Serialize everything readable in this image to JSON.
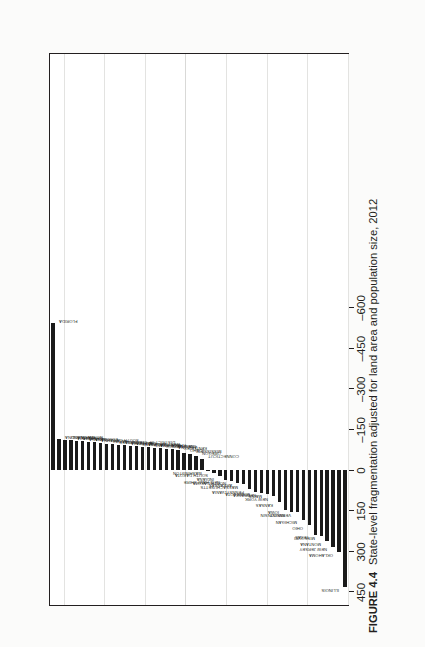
{
  "figure": {
    "number": "FIGURE 4.4",
    "caption": "State-level fragmentation adjusted for land area and population size, 2012"
  },
  "chart_data": {
    "type": "bar",
    "title": "State-level fragmentation adjusted for land area and population size, 2012",
    "xlabel": "",
    "ylabel": "",
    "orientation": "vertical-bars-on-rotated-page",
    "grid": true,
    "legend": null,
    "ylim": [
      -600,
      500
    ],
    "yticks": [
      -600,
      -450,
      -300,
      -150,
      0,
      150,
      300,
      450
    ],
    "ytick_labels": [
      "–600",
      "–450",
      "–300",
      "–150",
      "0",
      "150",
      "300",
      "450"
    ],
    "categories": [
      "FLORIDA",
      "NORTH CAROLINA",
      "MARYLAND",
      "VIRGINIA",
      "GEORGIA",
      "NEVADA",
      "LOUISIANA",
      "SOUTH CAROLINA",
      "UTAH",
      "HAWAII",
      "TENNESSEE",
      "DISTRICT OF COLUMBIA",
      "CALIFORNIA",
      "ALASKA",
      "DELAWARE",
      "WEST VIRGINIA",
      "RHODE ISLAND",
      "ALABAMA",
      "NEW MEXICO",
      "COLORADO",
      "ARIZONA",
      "KENTUCKY",
      "IDAHO",
      "MISSISSIPPI",
      "OREGON",
      "CONNECTICUT",
      "WASHINGTON",
      "SOUTH DAKOTA",
      "INDIANA",
      "NEW HAMPSHIRE",
      "NORTH DAKOTA",
      "ARKANSAS",
      "MASSACHUSETTS",
      "PENNSYLVANIA",
      "MINNESOTA",
      "NEBRASKA",
      "MAINE",
      "NEW YORK",
      "KANSAS",
      "IOWA",
      "WISCONSIN",
      "VERMONT",
      "MICHIGAN",
      "OHIO",
      "TEXAS",
      "MISSOURI",
      "MONTANA",
      "NEW JERSEY",
      "OKLAHOMA",
      "ILLINOIS"
    ],
    "values": [
      -540,
      -112,
      -110,
      -108,
      -106,
      -104,
      -102,
      -100,
      -98,
      -96,
      -94,
      -92,
      -90,
      -88,
      -86,
      -84,
      -82,
      -80,
      -78,
      -76,
      -74,
      -72,
      -62,
      -58,
      -50,
      -40,
      5,
      12,
      25,
      38,
      42,
      48,
      55,
      72,
      82,
      86,
      90,
      98,
      120,
      148,
      158,
      158,
      185,
      205,
      240,
      245,
      265,
      285,
      305,
      435
    ]
  },
  "axis": {
    "ticks": [
      {
        "value": -600,
        "label": "–600"
      },
      {
        "value": -450,
        "label": "–450"
      },
      {
        "value": -300,
        "label": "–300"
      },
      {
        "value": -150,
        "label": "–150"
      },
      {
        "value": 0,
        "label": "0"
      },
      {
        "value": 150,
        "label": "150"
      },
      {
        "value": 300,
        "label": "300"
      },
      {
        "value": 450,
        "label": "450"
      }
    ]
  },
  "colors": {
    "bar": "#1a1a1a",
    "frame": "#231f20",
    "grid": "#e3e3e1",
    "page": "#fbfbfa",
    "plot_bg": "#ffffff",
    "text": "#231f20"
  }
}
